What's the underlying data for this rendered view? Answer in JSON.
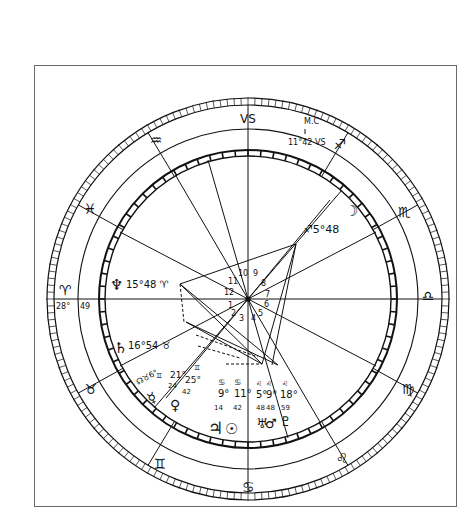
{
  "chart": {
    "center": [
      248,
      299
    ],
    "radii": {
      "outer_ring_outer": 201,
      "outer_ring_inner": 194,
      "sign_band_inner": 170,
      "inner_ring_outer": 149,
      "inner_ring_inner": 143
    },
    "ink_color": "#111111",
    "frame_color": "#6a6a6a"
  },
  "signs": [
    {
      "name": "capricorn",
      "glyph": "♑",
      "label": "VS",
      "x": 248,
      "y": 118
    },
    {
      "name": "aquarius",
      "glyph": "♒",
      "label": "≈",
      "x": 156,
      "y": 140
    },
    {
      "name": "sagittarius",
      "glyph": "♐",
      "label": "↗",
      "x": 340,
      "y": 144
    },
    {
      "name": "pisces",
      "glyph": "♓",
      "label": "♓",
      "x": 90,
      "y": 209
    },
    {
      "name": "scorpio",
      "glyph": "♏",
      "label": "♏",
      "x": 404,
      "y": 212
    },
    {
      "name": "aries",
      "glyph": "♈",
      "label": "♈",
      "x": 65,
      "y": 290
    },
    {
      "name": "libra",
      "glyph": "♎",
      "label": "♎",
      "x": 428,
      "y": 296
    },
    {
      "name": "taurus",
      "glyph": "♉",
      "label": "♉",
      "x": 91,
      "y": 389
    },
    {
      "name": "virgo",
      "glyph": "♍",
      "label": "♍",
      "x": 408,
      "y": 389
    },
    {
      "name": "gemini",
      "glyph": "♊",
      "label": "♊",
      "x": 160,
      "y": 464
    },
    {
      "name": "leo",
      "glyph": "♌",
      "label": "♌",
      "x": 342,
      "y": 458
    },
    {
      "name": "cancer",
      "glyph": "♋",
      "label": "♋",
      "x": 248,
      "y": 487
    }
  ],
  "sign_boundaries_deg": [
    0,
    30,
    60,
    90,
    120,
    150,
    180,
    210,
    240,
    270,
    300,
    330
  ],
  "house_cusps": {
    "numbers": [
      "1",
      "2",
      "3",
      "4",
      "5",
      "6",
      "7",
      "8",
      "9",
      "10",
      "11",
      "12"
    ]
  },
  "angles": {
    "mc": {
      "label": "M.C",
      "degree": "11°42 VS"
    },
    "asc": {
      "degree": "28°",
      "minutes": "49"
    }
  },
  "planets": [
    {
      "name": "neptune",
      "glyph": "♆",
      "degree": "15°",
      "minutes": "48",
      "sign": "♈"
    },
    {
      "name": "saturn",
      "glyph": "♄",
      "degree": "16°",
      "minutes": "54",
      "sign": "♉"
    },
    {
      "name": "moon",
      "glyph": "☽",
      "degree": "5°",
      "minutes": "48",
      "sign": "♐"
    },
    {
      "name": "north-node",
      "glyph": "☊",
      "degree": "6°",
      "minutes": "",
      "sign": "♉"
    },
    {
      "name": "mercury",
      "glyph": "☿",
      "degree": "21°",
      "minutes": "24",
      "sign": "♊"
    },
    {
      "name": "venus",
      "glyph": "♀",
      "degree": "25°",
      "minutes": "42",
      "sign": "♊"
    },
    {
      "name": "jupiter",
      "glyph": "♃",
      "degree": "9°",
      "minutes": "14",
      "sign": "♋"
    },
    {
      "name": "sun",
      "glyph": "☉",
      "degree": "11°",
      "minutes": "42",
      "sign": "♋"
    },
    {
      "name": "uranus",
      "glyph": "♅",
      "degree": "5°",
      "minutes": "48",
      "sign": "♌"
    },
    {
      "name": "mars",
      "glyph": "♂",
      "degree": "9°",
      "minutes": "48",
      "sign": "♌"
    },
    {
      "name": "pluto",
      "glyph": "♇",
      "degree": "18°",
      "minutes": "59",
      "sign": "♌"
    }
  ],
  "labels": {
    "mc_text": "M.C",
    "mc_degree": "11°42 VS",
    "asc_deg": "28°",
    "asc_min": "49",
    "neptune_text": "15°48 ♈",
    "saturn_text": "16°54 ♉",
    "moon_text": "♐5°48",
    "node_text": "☊♉6°",
    "mercury_deg": "21°",
    "mercury_min": "24",
    "venus_deg": "25°",
    "venus_min": "42",
    "gemini_small_1": "♊",
    "gemini_small_2": "♊",
    "cancer_small_1": "♋",
    "cancer_small_2": "♋",
    "jupiter_deg": "9°",
    "jupiter_min": "14",
    "sun_deg": "11°",
    "sun_min": "42",
    "leo_small_1": "♌",
    "leo_small_2": "♌",
    "leo_small_3": "♌",
    "uranus_deg": "5°",
    "uranus_min": "48",
    "mars_deg": "9°",
    "mars_min": "48",
    "pluto_deg": "18°",
    "pluto_min": "59"
  }
}
